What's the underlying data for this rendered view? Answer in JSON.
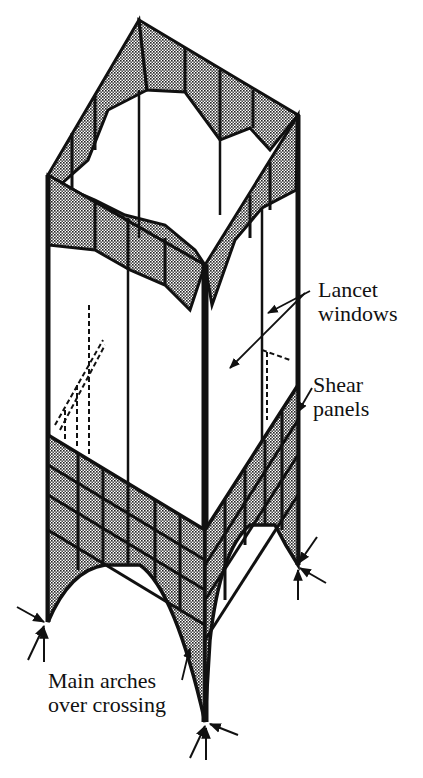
{
  "figure": {
    "type": "isometric structural diagram",
    "colors": {
      "ink": "#111111",
      "shade": "#9a9a9a",
      "background": "#ffffff"
    }
  },
  "labels": {
    "lancet_windows": {
      "line1": "Lancet",
      "line2": "windows"
    },
    "shear_panels": {
      "line1": "Shear",
      "line2": "panels"
    },
    "main_arches": {
      "line1": "Main arches",
      "line2": "over crossing"
    }
  }
}
